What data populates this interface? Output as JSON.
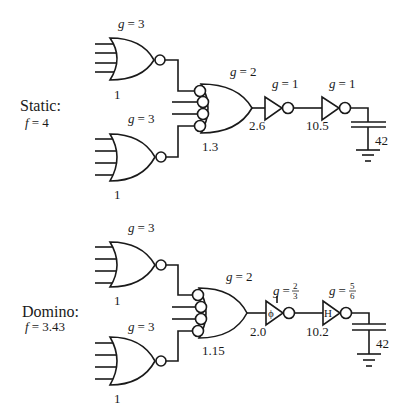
{
  "static": {
    "title": "Static:",
    "f_label": "f",
    "f_value": "= 4",
    "nor_top": {
      "g_label": "g",
      "g_value": "= 3",
      "size": "1"
    },
    "nor_bottom": {
      "g_label": "g",
      "g_value": "= 3",
      "size": "1"
    },
    "nand": {
      "g_label": "g",
      "g_value": "= 2",
      "size": "1.3"
    },
    "inv1": {
      "g_label": "g",
      "g_value": "= 1",
      "size": "2.6"
    },
    "inv2": {
      "g_label": "g",
      "g_value": "= 1",
      "size": "10.5"
    },
    "load": {
      "value": "42"
    }
  },
  "domino": {
    "title": "Domino:",
    "f_label": "f",
    "f_value": "= 3.43",
    "nor_top": {
      "g_label": "g",
      "g_value": "= 3",
      "size": "1"
    },
    "nor_bottom": {
      "g_label": "g",
      "g_value": "= 3",
      "size": "1"
    },
    "nand": {
      "g_label": "g",
      "g_value": "= 2",
      "size": "1.15"
    },
    "inv1": {
      "g_label": "g",
      "g_eq": "=",
      "g_num": "2",
      "g_den": "3",
      "symbol": "ϕ",
      "size": "2.0"
    },
    "inv2": {
      "g_label": "g",
      "g_eq": "=",
      "g_num": "5",
      "g_den": "6",
      "symbol": "H",
      "size": "10.2"
    },
    "load": {
      "value": "42"
    }
  }
}
